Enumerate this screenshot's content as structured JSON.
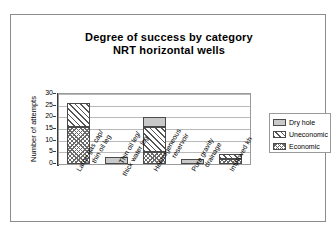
{
  "chart_data": {
    "type": "bar",
    "subtype": "stacked",
    "title": "Degree of success by category",
    "subtitle": "NRT horizontal wells",
    "xlabel": "",
    "ylabel": "Number of attempts",
    "ylim": [
      0,
      30
    ],
    "yticks": [
      0,
      5,
      10,
      15,
      20,
      25,
      30
    ],
    "grid": true,
    "legend_position": "right",
    "categories": [
      "Large gas cap/ thin oil leg",
      "Thin oil leg/ thick water leg",
      "Heterogeneous reservoir",
      "Pure gravity drainage",
      "Improved kh"
    ],
    "category_lines": [
      [
        "Large  gas  cap/",
        "thin  oil  leg"
      ],
      [
        "Thin  oil  leg/",
        "thick  water  leg"
      ],
      [
        "Heterogeneous",
        "reservoir"
      ],
      [
        "Pure  gravity",
        "drainage"
      ],
      [
        "Improved  kh"
      ]
    ],
    "series": [
      {
        "name": "Dry hole",
        "pattern": "solid-gray",
        "color": "#c9c9c9",
        "values": [
          0,
          3.2,
          4.0,
          2.3,
          0
        ]
      },
      {
        "name": "Uneconomic",
        "pattern": "diagonal-hatch",
        "color": "#ffffff",
        "values": [
          10.2,
          0,
          11.0,
          0,
          2.3
        ]
      },
      {
        "name": "Economic",
        "pattern": "crosshatch",
        "color": "#ffffff",
        "values": [
          16.0,
          0,
          5.0,
          0,
          2.2
        ]
      }
    ],
    "totals": [
      26.2,
      3.2,
      20.0,
      2.3,
      4.5
    ]
  },
  "legend": {
    "items": [
      {
        "label": "Dry  hole",
        "swatch": "solid-gray-swatch"
      },
      {
        "label": "Uneconomic",
        "swatch": "diagonal-hatch-swatch"
      },
      {
        "label": "Economic",
        "swatch": "crosshatch-swatch"
      }
    ]
  }
}
